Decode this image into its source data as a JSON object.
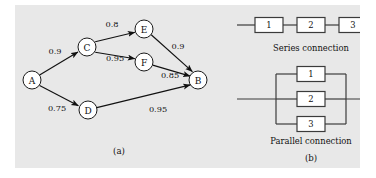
{
  "figure": {
    "background_color": "#e8e8e8",
    "page_color": "#ffffff",
    "ink_color": "#111111"
  },
  "panel_a": {
    "caption": "(a)",
    "nodes": [
      {
        "id": "A",
        "label": "A",
        "cx": 17,
        "cy": 75,
        "r": 9
      },
      {
        "id": "C",
        "label": "C",
        "cx": 72,
        "cy": 42,
        "r": 9
      },
      {
        "id": "D",
        "label": "D",
        "cx": 73,
        "cy": 105,
        "r": 9
      },
      {
        "id": "E",
        "label": "E",
        "cx": 129,
        "cy": 24,
        "r": 9
      },
      {
        "id": "F",
        "label": "F",
        "cx": 129,
        "cy": 57,
        "r": 9
      },
      {
        "id": "B",
        "label": "B",
        "cx": 183,
        "cy": 75,
        "r": 9
      }
    ],
    "edges": [
      {
        "from": "A",
        "to": "C",
        "weight": "0.9",
        "lx": 40,
        "ly": 46
      },
      {
        "from": "A",
        "to": "D",
        "weight": "0.75",
        "lx": 42,
        "ly": 103
      },
      {
        "from": "C",
        "to": "E",
        "weight": "0.8",
        "lx": 97,
        "ly": 19
      },
      {
        "from": "C",
        "to": "F",
        "weight": "0.95",
        "lx": 100,
        "ly": 53
      },
      {
        "from": "E",
        "to": "B",
        "weight": "0.9",
        "lx": 163,
        "ly": 41
      },
      {
        "from": "F",
        "to": "B",
        "weight": "0.85",
        "lx": 155,
        "ly": 70
      },
      {
        "from": "D",
        "to": "B",
        "weight": "0.95",
        "lx": 143,
        "ly": 104
      }
    ]
  },
  "panel_b": {
    "caption": "(b)",
    "series": {
      "caption": "Series connection",
      "blocks": [
        "1",
        "2",
        "3"
      ]
    },
    "parallel": {
      "caption": "Parallel connection",
      "blocks": [
        "1",
        "2",
        "3"
      ]
    }
  }
}
